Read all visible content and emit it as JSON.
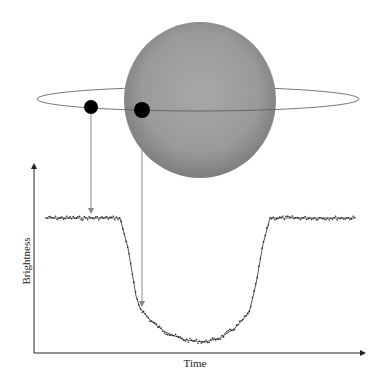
{
  "diagram": {
    "star": {
      "cx": 200,
      "cy": 100,
      "rx": 76,
      "ry": 78,
      "color_edge": "#808080",
      "color_center": "#a6a6a6"
    },
    "orbit": {
      "cx": 198,
      "cy": 99,
      "rx": 161,
      "ry": 12,
      "color": "#555555"
    },
    "planets": [
      {
        "cx": 91,
        "cy": 107,
        "r": 7,
        "color": "#000000"
      },
      {
        "cx": 142,
        "cy": 110,
        "r": 8,
        "color": "#000000"
      }
    ],
    "pointer_arrows": [
      {
        "x": 91,
        "y1": 114,
        "y2": 213
      },
      {
        "x": 142,
        "y1": 118,
        "y2": 306
      }
    ]
  },
  "axes": {
    "x_label": "Time",
    "y_label": "Brightness"
  },
  "chart_data": {
    "type": "line",
    "title": "",
    "xlabel": "Time",
    "ylabel": "Brightness",
    "grid": false,
    "curve_pixels": [
      [
        46,
        218
      ],
      [
        120,
        218
      ],
      [
        128,
        248
      ],
      [
        136,
        296
      ],
      [
        140,
        308
      ],
      [
        150,
        320
      ],
      [
        165,
        332
      ],
      [
        185,
        340
      ],
      [
        205,
        342
      ],
      [
        220,
        338
      ],
      [
        235,
        328
      ],
      [
        249,
        313
      ],
      [
        256,
        284
      ],
      [
        263,
        244
      ],
      [
        270,
        218
      ],
      [
        355,
        218
      ]
    ]
  }
}
